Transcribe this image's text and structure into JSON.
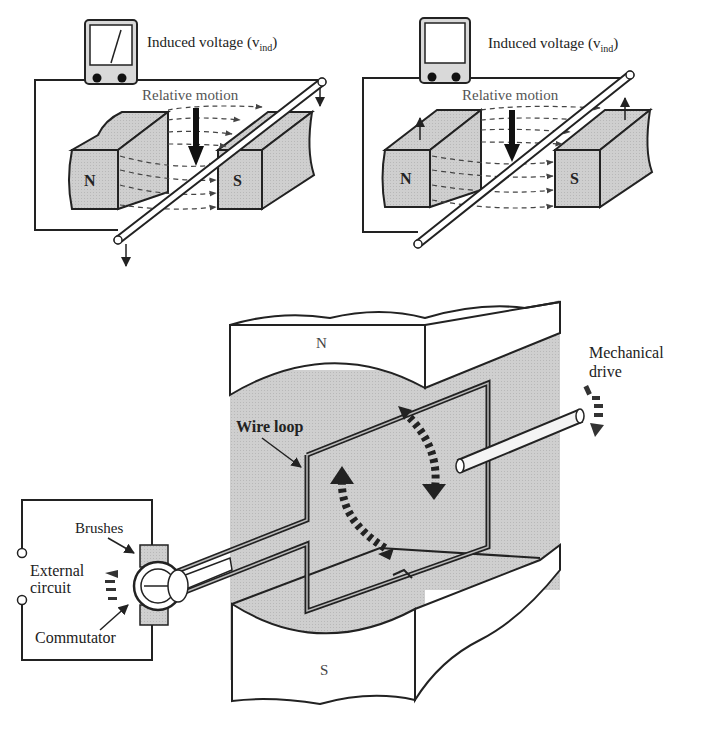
{
  "panels": {
    "top_left": {
      "meter_label": "Induced voltage (v",
      "meter_subscript": "ind",
      "meter_label_close": ")",
      "motion_label": "Relative motion",
      "north_label": "N",
      "south_label": "S",
      "meter_state": "deflected"
    },
    "top_right": {
      "meter_label": "Induced voltage (v",
      "meter_subscript": "ind",
      "meter_label_close": ")",
      "motion_label": "Relative motion",
      "north_label": "N",
      "south_label": "S",
      "meter_state": "zero"
    },
    "bottom": {
      "north_label": "N",
      "south_label": "S",
      "wire_loop_label": "Wire loop",
      "mechanical_drive_label_1": "Mechanical",
      "mechanical_drive_label_2": "drive",
      "brushes_label": "Brushes",
      "external_circuit_label_1": "External",
      "external_circuit_label_2": "circuit",
      "commutator_label": "Commutator"
    }
  },
  "colors": {
    "shade": "#c8c8c8",
    "line": "#1a1a1a",
    "background": "#ffffff"
  }
}
